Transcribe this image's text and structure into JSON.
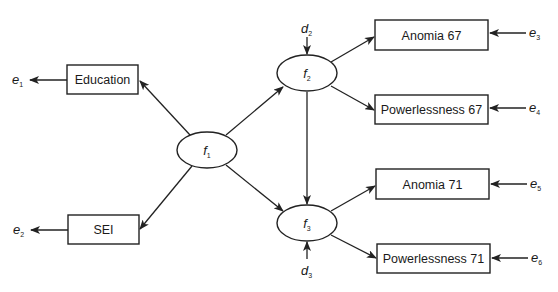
{
  "diagram": {
    "type": "structural-equation-model",
    "latent_factors": [
      {
        "id": "f1",
        "label": "f",
        "sub": "1"
      },
      {
        "id": "f2",
        "label": "f",
        "sub": "2"
      },
      {
        "id": "f3",
        "label": "f",
        "sub": "3"
      }
    ],
    "observed": [
      {
        "id": "education",
        "label": "Education",
        "error": {
          "label": "e",
          "sub": "1"
        }
      },
      {
        "id": "sei",
        "label": "SEI",
        "error": {
          "label": "e",
          "sub": "2"
        }
      },
      {
        "id": "anomia67",
        "label": "Anomia 67",
        "error": {
          "label": "e",
          "sub": "3"
        }
      },
      {
        "id": "powerlessness67",
        "label": "Powerlessness 67",
        "error": {
          "label": "e",
          "sub": "4"
        }
      },
      {
        "id": "anomia71",
        "label": "Anomia 71",
        "error": {
          "label": "e",
          "sub": "5"
        }
      },
      {
        "id": "powerlessness71",
        "label": "Powerlessness 71",
        "error": {
          "label": "e",
          "sub": "6"
        }
      }
    ],
    "disturbances": [
      {
        "id": "d2",
        "label": "d",
        "sub": "2",
        "target": "f2"
      },
      {
        "id": "d3",
        "label": "d",
        "sub": "3",
        "target": "f3"
      }
    ],
    "paths": [
      {
        "from": "f1",
        "to": "education"
      },
      {
        "from": "f1",
        "to": "sei"
      },
      {
        "from": "f1",
        "to": "f2"
      },
      {
        "from": "f1",
        "to": "f3"
      },
      {
        "from": "f2",
        "to": "f3"
      },
      {
        "from": "f2",
        "to": "anomia67"
      },
      {
        "from": "f2",
        "to": "powerlessness67"
      },
      {
        "from": "f3",
        "to": "anomia71"
      },
      {
        "from": "f3",
        "to": "powerlessness71"
      },
      {
        "from": "education",
        "to": "e1"
      },
      {
        "from": "sei",
        "to": "e2"
      },
      {
        "from": "e3",
        "to": "anomia67"
      },
      {
        "from": "e4",
        "to": "powerlessness67"
      },
      {
        "from": "e5",
        "to": "anomia71"
      },
      {
        "from": "e6",
        "to": "powerlessness71"
      },
      {
        "from": "d2",
        "to": "f2"
      },
      {
        "from": "d3",
        "to": "f3"
      }
    ]
  }
}
